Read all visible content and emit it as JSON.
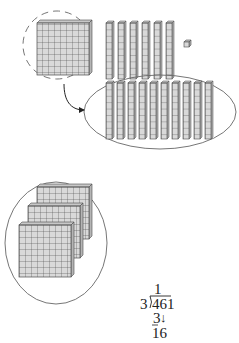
{
  "diagram": {
    "title": "",
    "colors": {
      "block_fill": "#d9d9d9",
      "block_side": "#b5b5b5",
      "block_line": "#4a4a4a",
      "outline": "#555555"
    },
    "groups": [
      {
        "name": "regrouped-hundred",
        "type": "flat",
        "count": 1,
        "outline": "dashed-circle"
      },
      {
        "name": "tens-rods",
        "type": "rod",
        "count": 6
      },
      {
        "name": "unit-cube",
        "type": "unit",
        "count": 1
      },
      {
        "name": "ten-rods-group",
        "type": "rod",
        "count": 10,
        "outline": "ellipse"
      },
      {
        "name": "hundreds-flats",
        "type": "flat",
        "count": 3,
        "outline": "ellipse"
      }
    ],
    "arrow": {
      "from": "regrouped-hundred",
      "to": "ten-rods-group"
    }
  },
  "division": {
    "quotient": "1",
    "divisor": "3",
    "dividend": "461",
    "subtract": "3",
    "remainder_bring_down": "16",
    "bring_down_arrow": "↓"
  }
}
